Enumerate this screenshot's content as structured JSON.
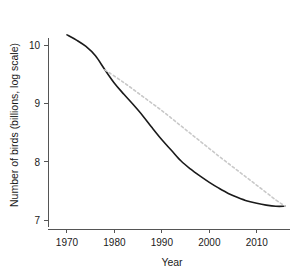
{
  "chart_data": {
    "type": "line",
    "title": "",
    "xlabel": "Year",
    "ylabel": "Number of birds (billions, log scale)",
    "xlim": [
      1966,
      2017
    ],
    "ylim": [
      6.85,
      10.4
    ],
    "xticks": [
      1970,
      1980,
      1990,
      2000,
      2010
    ],
    "xtick_labels": [
      "1970",
      "1980",
      "1990",
      "2000",
      "2010"
    ],
    "yticks": [
      7,
      8,
      9,
      10
    ],
    "ytick_labels": [
      "7",
      "8",
      "9",
      "10"
    ],
    "grid": false,
    "legend": "none",
    "series": [
      {
        "name": "observed",
        "style": "solid",
        "color": "#1a1a1a",
        "x": [
          1970,
          1972,
          1974,
          1976,
          1978,
          1980,
          1982,
          1984,
          1986,
          1988,
          1990,
          1992,
          1994,
          1996,
          1998,
          2000,
          2002,
          2004,
          2006,
          2008,
          2010,
          2012,
          2014,
          2016
        ],
        "y": [
          10.18,
          10.09,
          9.98,
          9.82,
          9.58,
          9.35,
          9.16,
          8.98,
          8.79,
          8.58,
          8.38,
          8.2,
          8.02,
          7.88,
          7.76,
          7.65,
          7.55,
          7.46,
          7.39,
          7.33,
          7.29,
          7.26,
          7.24,
          7.24
        ]
      },
      {
        "name": "counterfactual",
        "style": "dashed",
        "color": "#c9c9c9",
        "x": [
          1978,
          1982,
          1986,
          1990,
          1994,
          1998,
          2002,
          2006,
          2010,
          2014,
          2016
        ],
        "y": [
          9.58,
          9.36,
          9.12,
          8.88,
          8.62,
          8.36,
          8.1,
          7.85,
          7.6,
          7.35,
          7.24
        ]
      }
    ]
  },
  "axes": {
    "x_title": "Year",
    "y_title": "Number of birds (billions, log scale)"
  }
}
